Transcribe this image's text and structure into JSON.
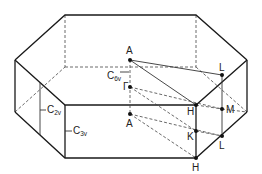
{
  "diagram": {
    "labels": {
      "A_top": "A",
      "Gamma": "Γ",
      "A_bottom": "A",
      "H_top": "H",
      "K": "K",
      "H_bottom": "H",
      "L_top": "L",
      "M": "M",
      "L_bottom": "L",
      "C6v": "C",
      "C6v_sub": "6v",
      "C2v": "C",
      "C2v_sub": "2v",
      "C3v": "C",
      "C3v_sub": "3v"
    }
  }
}
